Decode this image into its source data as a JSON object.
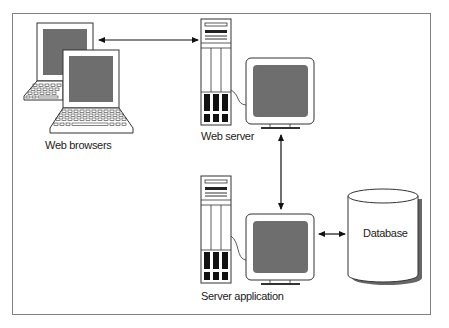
{
  "diagram": {
    "type": "architecture",
    "nodes": [
      {
        "id": "web-browsers",
        "label": "Web browsers",
        "icon": "laptop-icon",
        "count": 2
      },
      {
        "id": "web-server",
        "label": "Web server",
        "icon": "server-tower-with-monitor-icon"
      },
      {
        "id": "server-application",
        "label": "Server application",
        "icon": "server-tower-with-monitor-icon"
      },
      {
        "id": "database",
        "label": "Database",
        "icon": "database-cylinder-icon"
      }
    ],
    "edges": [
      {
        "from": "web-browsers",
        "to": "web-server",
        "direction": "bidirectional"
      },
      {
        "from": "web-server",
        "to": "server-application",
        "direction": "bidirectional"
      },
      {
        "from": "server-application",
        "to": "database",
        "direction": "bidirectional"
      }
    ]
  },
  "labels": {
    "web_browsers": "Web browsers",
    "web_server": "Web server",
    "server_application": "Server application",
    "database": "Database"
  },
  "colors": {
    "frame": "#808080",
    "outline": "#333333",
    "screen": "#6e6e6e",
    "drive_bay": "#111111",
    "shadow": "#666666"
  }
}
